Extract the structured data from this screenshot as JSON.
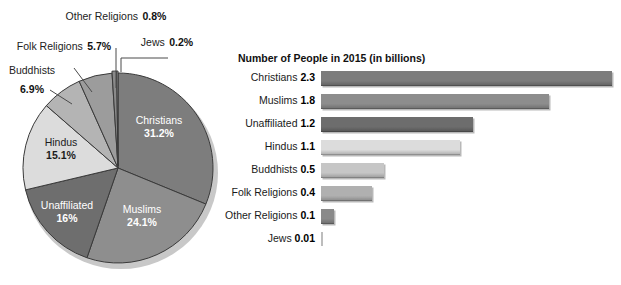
{
  "pie": {
    "center": {
      "x": 118,
      "y": 168
    },
    "radius": 95,
    "slices": [
      {
        "label": "Christians",
        "pct_text": "31.2%",
        "value": 31.2,
        "color": "#7d7d7d",
        "text_color": "#ffffff",
        "inside": true
      },
      {
        "label": "Muslims",
        "pct_text": "24.1%",
        "value": 24.1,
        "color": "#8e8e8e",
        "text_color": "#ffffff",
        "inside": true
      },
      {
        "label": "Unaffiliated",
        "pct_text": "16%",
        "value": 16.0,
        "color": "#6e6e6e",
        "text_color": "#ffffff",
        "inside": true
      },
      {
        "label": "Hindus",
        "pct_text": "15.1%",
        "value": 15.1,
        "color": "#dcdcdc",
        "text_color": "#1b1b1b",
        "inside": true
      },
      {
        "label": "Buddhists",
        "pct_text": "6.9%",
        "value": 6.9,
        "color": "#b4b4b4",
        "text_color": "#1b1b1b",
        "inside": false
      },
      {
        "label": "Folk Religions",
        "pct_text": "5.7%",
        "value": 5.7,
        "color": "#9c9c9c",
        "text_color": "#1b1b1b",
        "inside": false
      },
      {
        "label": "Other Religions",
        "pct_text": "0.8%",
        "value": 0.8,
        "color": "#8a8a8a",
        "text_color": "#1b1b1b",
        "inside": false
      },
      {
        "label": "Jews",
        "pct_text": "0.2%",
        "value": 0.2,
        "color": "#c9c9c9",
        "text_color": "#1b1b1b",
        "inside": false
      }
    ]
  },
  "bar_chart": {
    "title": "Number of People in 2015 (in billions)",
    "axis_max": 2.3,
    "rows": [
      {
        "label": "Christians",
        "value_text": "2.3",
        "value": 2.3,
        "color": "#7c7c7c"
      },
      {
        "label": "Muslims",
        "value_text": "1.8",
        "value": 1.8,
        "color": "#8d8d8d"
      },
      {
        "label": "Unaffiliated",
        "value_text": "1.2",
        "value": 1.2,
        "color": "#6d6d6d"
      },
      {
        "label": "Hindus",
        "value_text": "1.1",
        "value": 1.1,
        "color": "#dcdcdc"
      },
      {
        "label": "Buddhists",
        "value_text": "0.5",
        "value": 0.5,
        "color": "#c6c6c6"
      },
      {
        "label": "Folk Religions",
        "value_text": "0.4",
        "value": 0.4,
        "color": "#b0b0b0"
      },
      {
        "label": "Other Religions",
        "value_text": "0.1",
        "value": 0.1,
        "color": "#8a8a8a"
      },
      {
        "label": "Jews",
        "value_text": "0.01",
        "value": 0.01,
        "color": "#c9c9c9"
      }
    ]
  },
  "chart_data": [
    {
      "type": "pie",
      "title": "",
      "categories": [
        "Christians",
        "Muslims",
        "Unaffiliated",
        "Hindus",
        "Buddhists",
        "Folk Religions",
        "Other Religions",
        "Jews"
      ],
      "values": [
        31.2,
        24.1,
        16.0,
        15.1,
        6.9,
        5.7,
        0.8,
        0.2
      ],
      "unit": "percent",
      "labels": [
        "31.2%",
        "24.1%",
        "16%",
        "15.1%",
        "6.9%",
        "5.7%",
        "0.8%",
        "0.2%"
      ],
      "legend": "none",
      "notes": "Slices ordered clockwise starting at 12 o'clock; exploded/3D style with drop shadow."
    },
    {
      "type": "bar",
      "orientation": "horizontal",
      "title": "Number of People in 2015 (in billions)",
      "categories": [
        "Christians",
        "Muslims",
        "Unaffiliated",
        "Hindus",
        "Buddhists",
        "Folk Religions",
        "Other Religions",
        "Jews"
      ],
      "values": [
        2.3,
        1.8,
        1.2,
        1.1,
        0.5,
        0.4,
        0.1,
        0.01
      ],
      "xlabel": "",
      "ylabel": "",
      "xlim": [
        0,
        2.3
      ],
      "grid": false,
      "legend": "none",
      "data_labels": [
        "2.3",
        "1.8",
        "1.2",
        "1.1",
        "0.5",
        "0.4",
        "0.1",
        "0.01"
      ]
    }
  ]
}
